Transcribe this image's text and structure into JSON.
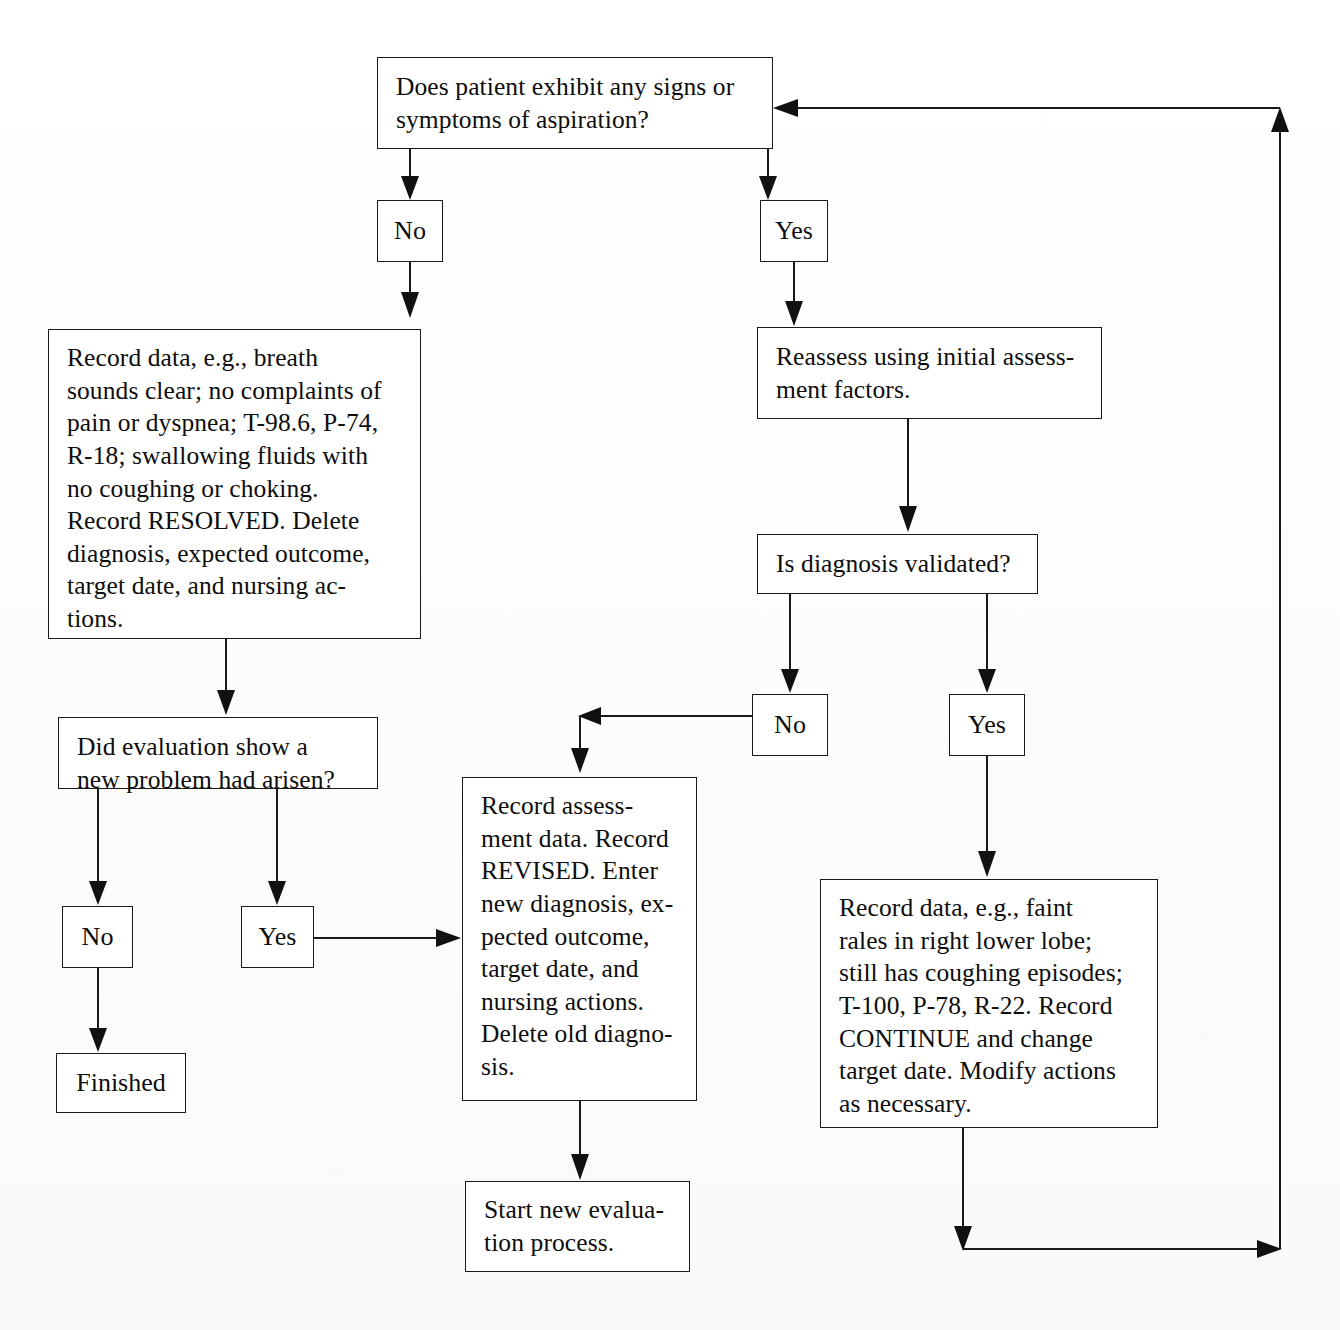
{
  "diagram": {
    "type": "flowchart",
    "background_color": "#fdfdfd",
    "line_color": "#1a1a1a",
    "text_color": "#0d0d0d"
  },
  "nodes": {
    "q_signs": {
      "id": "q_signs",
      "shape": "rect",
      "text": "Does patient exhibit any signs or\nsymptoms of aspiration?",
      "x": 377,
      "y": 57,
      "w": 396,
      "h": 92
    },
    "no_top": {
      "id": "no_top",
      "shape": "rect",
      "text": "No",
      "x": 377,
      "y": 200,
      "w": 66,
      "h": 62
    },
    "yes_top": {
      "id": "yes_top",
      "shape": "rect",
      "text": "Yes",
      "x": 760,
      "y": 200,
      "w": 68,
      "h": 62
    },
    "record_resolved": {
      "id": "record_resolved",
      "shape": "rect",
      "text": "Record data, e.g., breath\nsounds clear; no complaints of\npain or dyspnea; T-98.6, P-74,\nR-18; swallowing fluids with\nno coughing or choking.\nRecord RESOLVED. Delete\ndiagnosis, expected outcome,\ntarget date, and nursing ac-\ntions.",
      "x": 48,
      "y": 329,
      "w": 373,
      "h": 310
    },
    "reassess": {
      "id": "reassess",
      "shape": "rect",
      "text": "Reassess using initial assess-\nment factors.",
      "x": 757,
      "y": 327,
      "w": 345,
      "h": 92
    },
    "q_validated": {
      "id": "q_validated",
      "shape": "rect",
      "text": "Is diagnosis validated?",
      "x": 757,
      "y": 534,
      "w": 281,
      "h": 60
    },
    "no_validated": {
      "id": "no_validated",
      "shape": "rect",
      "text": "No",
      "x": 752,
      "y": 694,
      "w": 76,
      "h": 62
    },
    "yes_validated": {
      "id": "yes_validated",
      "shape": "rect",
      "text": "Yes",
      "x": 949,
      "y": 694,
      "w": 76,
      "h": 62
    },
    "q_new_problem": {
      "id": "q_new_problem",
      "shape": "rect",
      "text": "Did evaluation show a\nnew problem had arisen?",
      "x": 58,
      "y": 717,
      "w": 320,
      "h": 72
    },
    "no_bottom": {
      "id": "no_bottom",
      "shape": "rect",
      "text": "No",
      "x": 62,
      "y": 906,
      "w": 71,
      "h": 62
    },
    "yes_bottom": {
      "id": "yes_bottom",
      "shape": "rect",
      "text": "Yes",
      "x": 241,
      "y": 906,
      "w": 73,
      "h": 62
    },
    "finished": {
      "id": "finished",
      "shape": "rect",
      "text": "Finished",
      "x": 56,
      "y": 1053,
      "w": 130,
      "h": 60
    },
    "record_revised": {
      "id": "record_revised",
      "shape": "rect",
      "text": "Record assess-\nment data. Record\nREVISED. Enter\nnew diagnosis, ex-\npected outcome,\ntarget date, and\nnursing actions.\nDelete old diagno-\nsis.",
      "x": 462,
      "y": 777,
      "w": 235,
      "h": 324
    },
    "record_continue": {
      "id": "record_continue",
      "shape": "rect",
      "text": "Record data, e.g., faint\nrales in right lower lobe;\nstill has coughing episodes;\nT-100, P-78, R-22. Record\nCONTINUE and change\ntarget date. Modify actions\nas necessary.",
      "x": 820,
      "y": 879,
      "w": 338,
      "h": 249
    },
    "start_new": {
      "id": "start_new",
      "shape": "rect",
      "text": "Start new evalua-\ntion process.",
      "x": 465,
      "y": 1181,
      "w": 225,
      "h": 91
    }
  },
  "edges": [
    {
      "id": "e-q-to-no-top",
      "from": "q_signs",
      "to": "no_top",
      "label": ""
    },
    {
      "id": "e-q-to-yes-top",
      "from": "q_signs",
      "to": "yes_top",
      "label": ""
    },
    {
      "id": "e-no-top-to-resolved",
      "from": "no_top",
      "to": "record_resolved",
      "label": ""
    },
    {
      "id": "e-yes-top-to-reassess",
      "from": "yes_top",
      "to": "reassess",
      "label": ""
    },
    {
      "id": "e-reassess-to-validated",
      "from": "reassess",
      "to": "q_validated",
      "label": ""
    },
    {
      "id": "e-validated-to-no",
      "from": "q_validated",
      "to": "no_validated",
      "label": ""
    },
    {
      "id": "e-validated-to-yes",
      "from": "q_validated",
      "to": "yes_validated",
      "label": ""
    },
    {
      "id": "e-no-validated-to-revised",
      "from": "no_validated",
      "to": "record_revised",
      "label": ""
    },
    {
      "id": "e-yes-validated-to-continue",
      "from": "yes_validated",
      "to": "record_continue",
      "label": ""
    },
    {
      "id": "e-resolved-to-newproblem",
      "from": "record_resolved",
      "to": "q_new_problem",
      "label": ""
    },
    {
      "id": "e-newproblem-to-no",
      "from": "q_new_problem",
      "to": "no_bottom",
      "label": ""
    },
    {
      "id": "e-newproblem-to-yes",
      "from": "q_new_problem",
      "to": "yes_bottom",
      "label": ""
    },
    {
      "id": "e-no-bottom-to-finished",
      "from": "no_bottom",
      "to": "finished",
      "label": ""
    },
    {
      "id": "e-yes-bottom-to-revised",
      "from": "yes_bottom",
      "to": "record_revised",
      "label": ""
    },
    {
      "id": "e-revised-to-start-new",
      "from": "record_revised",
      "to": "start_new",
      "label": ""
    },
    {
      "id": "e-continue-loop-back",
      "from": "record_continue",
      "to": "q_signs",
      "label": ""
    }
  ]
}
